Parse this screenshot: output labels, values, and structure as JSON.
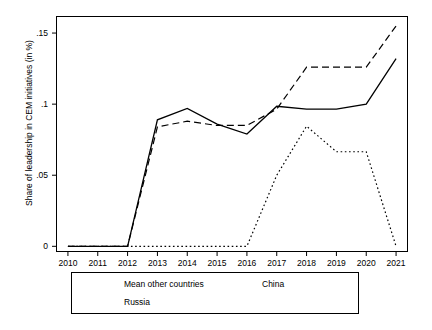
{
  "chart_data": {
    "type": "line",
    "title": "",
    "xlabel": "",
    "ylabel": "Share of leadership in CEM initiatives (in %)",
    "x": [
      2010,
      2011,
      2012,
      2013,
      2014,
      2015,
      2016,
      2017,
      2018,
      2019,
      2020,
      2021
    ],
    "xtick_labels": [
      "2010",
      "2011",
      "2012",
      "2013",
      "2014",
      "2015",
      "2016",
      "2017",
      "2018",
      "2019",
      "2020",
      "2021"
    ],
    "ytick_labels": [
      "0",
      ".05",
      ".1",
      ".15"
    ],
    "ytick_values": [
      0,
      0.05,
      0.1,
      0.15
    ],
    "ylim": [
      -0.004,
      0.162
    ],
    "xlim": [
      2009.6,
      2021.4
    ],
    "grid": false,
    "legend_position": "below-plot",
    "series": [
      {
        "name": "Mean other countries",
        "style": "solid",
        "values": [
          0.0,
          0.0,
          0.0,
          0.089,
          0.097,
          0.086,
          0.079,
          0.0985,
          0.0965,
          0.0965,
          0.1,
          0.132
        ]
      },
      {
        "name": "China",
        "style": "dashed",
        "values": [
          0.0,
          0.0,
          0.0,
          0.084,
          0.088,
          0.085,
          0.085,
          0.0965,
          0.126,
          0.126,
          0.126,
          0.155
        ]
      },
      {
        "name": "Russia",
        "style": "dotted",
        "values": [
          0.0,
          0.0,
          0.0,
          0.0,
          0.0,
          0.0,
          0.0,
          0.05,
          0.0845,
          0.0665,
          0.0665,
          0.0
        ]
      }
    ]
  },
  "legend": {
    "entries": [
      {
        "label": "Mean other countries",
        "style": "solid"
      },
      {
        "label": "China",
        "style": "dashed"
      },
      {
        "label": "Russia",
        "style": "dotted"
      }
    ]
  },
  "axes": {
    "y_label_text": "Share of leadership in CEM initiatives (in %)"
  }
}
